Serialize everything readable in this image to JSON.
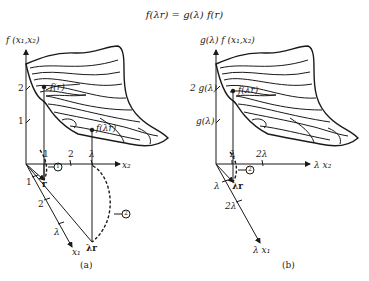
{
  "equation": "f(λr) = g(λ) f(r)",
  "panel_a": {
    "caption": "(a)",
    "z_axis_label": "f (x₁,x₂)",
    "x2_axis_label": "x₂",
    "x1_axis_label": "x₁",
    "z_ticks": [
      "2",
      "1"
    ],
    "x2_ticks": [
      "1",
      "2",
      "λ"
    ],
    "x1_ticks": [
      "1",
      "2",
      "λ"
    ],
    "point_r": "r",
    "point_lambda_r": "λr",
    "surface_point_r": "f(r)",
    "surface_point_lambda_r": "f(λr)",
    "marker_1": "1",
    "marker_2": "2"
  },
  "panel_b": {
    "caption": "(b)",
    "z_axis_label": "g(λ) f (x₁,x₂)",
    "x2_axis_label": "λ x₂",
    "x1_axis_label": "λ x₁",
    "z_ticks": [
      "2 g(λ)",
      "g(λ)"
    ],
    "x2_ticks": [
      "λ",
      "2λ"
    ],
    "x1_ticks": [
      "λ",
      "2λ"
    ],
    "point_lambda_r": "λr",
    "surface_point_lambda_r": "f(λr)",
    "marker_2": "2"
  }
}
